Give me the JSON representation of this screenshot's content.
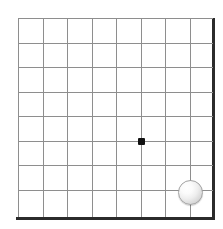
{
  "figure": {
    "board_color": "#ffffff",
    "grid_line_color": "#8e8e8e",
    "border_color": "#2b2b2b",
    "width_px": 223,
    "height_px": 229
  },
  "board": {
    "columns": 9,
    "rows": 9,
    "origin_x": 18,
    "origin_y": 18,
    "spacing": 24.5,
    "thick_edges": [
      "right",
      "bottom"
    ],
    "vertical_lines_x": [
      18,
      42.5,
      67,
      91.5,
      116,
      140.5,
      165,
      189.5,
      212
    ],
    "horizontal_lines_y": [
      18,
      42.5,
      67,
      91.5,
      116,
      140.5,
      165,
      189.5,
      217
    ]
  },
  "markers": [
    {
      "name": "star-point",
      "type": "hoshi",
      "color": "#111111",
      "col": 5,
      "row": 5,
      "cx": 141,
      "cy": 141,
      "size": 7
    }
  ],
  "stones": [
    {
      "name": "white-stone",
      "color": "white",
      "fill": "#ffffff",
      "edge": "#a3a3a3",
      "col": 7,
      "row": 7,
      "cx": 190,
      "cy": 192,
      "radius": 12.5
    }
  ]
}
